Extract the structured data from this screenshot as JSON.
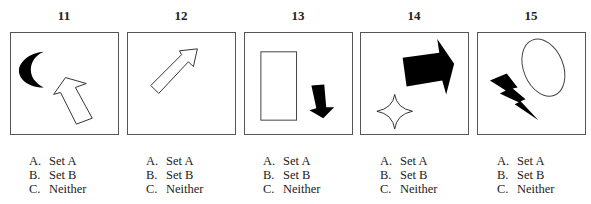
{
  "questions": [
    {
      "number": "11",
      "shapes": [
        "black-crescent",
        "white-block-arrow-up-left"
      ],
      "options": [
        {
          "letter": "A.",
          "label": "Set A"
        },
        {
          "letter": "B.",
          "label": "Set B"
        },
        {
          "letter": "C.",
          "label": "Neither"
        }
      ]
    },
    {
      "number": "12",
      "shapes": [
        "white-arrow-up-right"
      ],
      "options": [
        {
          "letter": "A.",
          "label": "Set A"
        },
        {
          "letter": "B.",
          "label": "Set B"
        },
        {
          "letter": "C.",
          "label": "Neither"
        }
      ]
    },
    {
      "number": "13",
      "shapes": [
        "white-rectangle",
        "black-arrow-down"
      ],
      "options": [
        {
          "letter": "A.",
          "label": "Set A"
        },
        {
          "letter": "B.",
          "label": "Set B"
        },
        {
          "letter": "C.",
          "label": "Neither"
        }
      ]
    },
    {
      "number": "14",
      "shapes": [
        "black-block-arrow-right",
        "white-four-point-star"
      ],
      "options": [
        {
          "letter": "A.",
          "label": "Set A"
        },
        {
          "letter": "B.",
          "label": "Set B"
        },
        {
          "letter": "C.",
          "label": "Neither"
        }
      ]
    },
    {
      "number": "15",
      "shapes": [
        "white-ellipse",
        "black-lightning-bolt"
      ],
      "options": [
        {
          "letter": "A.",
          "label": "Set A"
        },
        {
          "letter": "B.",
          "label": "Set B"
        },
        {
          "letter": "C.",
          "label": "Neither"
        }
      ]
    }
  ],
  "colors": {
    "border": "#555555",
    "fill_black": "#000000",
    "fill_white": "#ffffff"
  }
}
